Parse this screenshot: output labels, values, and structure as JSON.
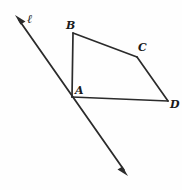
{
  "figure": {
    "type": "geometry-diagram",
    "width": 182,
    "height": 190,
    "background_color": "#fefefe",
    "stroke_color": "#2b2b2b",
    "label_color": "#1a1a1a",
    "points": {
      "A": {
        "label": "A",
        "x": 72,
        "y": 97,
        "label_x": 75,
        "label_y": 85
      },
      "B": {
        "label": "B",
        "x": 73,
        "y": 33,
        "label_x": 66,
        "label_y": 20
      },
      "C": {
        "label": "C",
        "x": 137,
        "y": 57,
        "label_x": 138,
        "label_y": 42
      },
      "D": {
        "label": "D",
        "x": 168,
        "y": 101,
        "label_x": 170,
        "label_y": 99
      }
    },
    "line": {
      "label": "ℓ",
      "label_x": 27,
      "label_y": 13,
      "arrow_start_x": 15,
      "arrow_start_y": 15,
      "arrow_end_x": 128,
      "arrow_end_y": 176,
      "double_headed": true,
      "passes_through": "A"
    },
    "segments": [
      {
        "name": "segment-AB",
        "from": "A",
        "to": "B"
      },
      {
        "name": "segment-BC",
        "from": "B",
        "to": "C"
      },
      {
        "name": "segment-CD",
        "from": "C",
        "to": "D"
      },
      {
        "name": "segment-AD",
        "from": "A",
        "to": "D"
      }
    ]
  }
}
